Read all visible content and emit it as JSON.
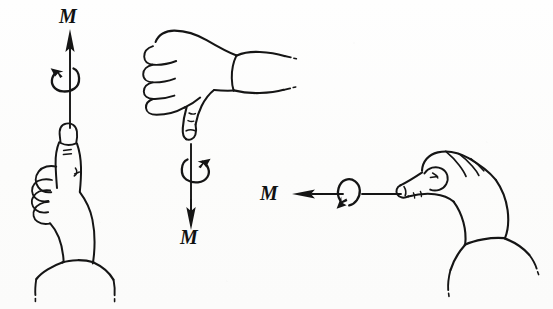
{
  "figure": {
    "kind": "line-drawing",
    "background_color": "#fdfdfc",
    "ink_color": "#151515",
    "width": 553,
    "height": 309
  },
  "labels": {
    "moment_up": "M",
    "moment_down": "M",
    "moment_left": "M"
  },
  "groups": [
    {
      "id": "left-group",
      "name": "thumb-up-hand-with-upward-moment",
      "hand_pose": "thumbs-up, fingers curled, palm facing viewer",
      "hand_orientation": "vertical",
      "arrow_direction": "up",
      "curl_direction": "counterclockwise",
      "label": "M"
    },
    {
      "id": "center-group",
      "name": "thumb-down-hand-with-downward-moment",
      "hand_pose": "thumbs-down, fist with knuckles to the left",
      "hand_orientation": "horizontal, wrist to the right",
      "arrow_direction": "down",
      "curl_direction": "clockwise",
      "label": "M"
    },
    {
      "id": "right-group",
      "name": "thumb-left-hand-with-leftward-moment",
      "hand_pose": "fist with thumb extended to the left",
      "hand_orientation": "horizontal, wrist to the lower right",
      "arrow_direction": "left",
      "curl_direction": "clockwise",
      "label": "M"
    }
  ],
  "icons": {
    "arrow_up": "arrow-up-icon",
    "arrow_down": "arrow-down-icon",
    "arrow_left": "arrow-left-icon",
    "curl_ccw": "rotation-curl-counterclockwise-icon",
    "curl_cw": "rotation-curl-clockwise-icon",
    "hand_thumb_up": "hand-thumb-up-icon",
    "hand_thumb_down": "hand-thumb-down-icon",
    "hand_thumb_left": "hand-thumb-left-icon"
  }
}
